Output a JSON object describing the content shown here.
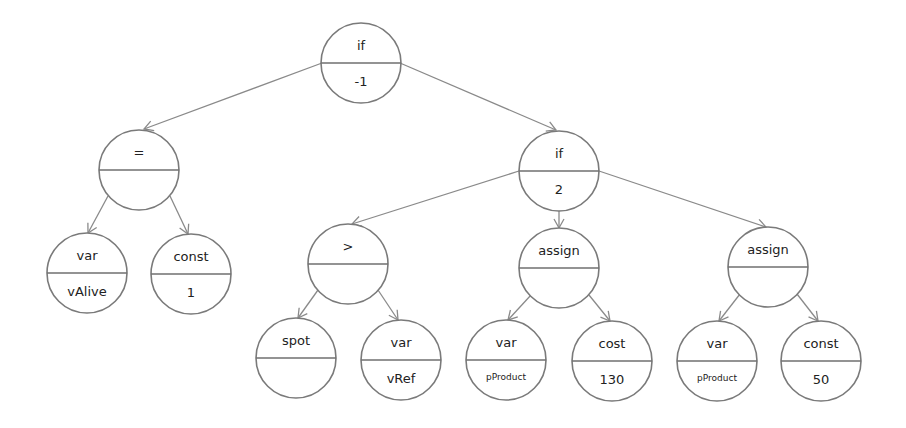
{
  "diagram": {
    "type": "expression-tree",
    "nodes": [
      {
        "id": "n0",
        "op": "if",
        "value": "-1",
        "cx": 361,
        "cy": 63,
        "r": 40
      },
      {
        "id": "n1",
        "op": "=",
        "value": "",
        "cx": 139,
        "cy": 170,
        "r": 40
      },
      {
        "id": "n2",
        "op": "if",
        "value": "2",
        "cx": 559,
        "cy": 171,
        "r": 40
      },
      {
        "id": "n3",
        "op": "var",
        "value": "vAlive",
        "cx": 87,
        "cy": 273,
        "r": 40
      },
      {
        "id": "n4",
        "op": "const",
        "value": "1",
        "cx": 191,
        "cy": 274,
        "r": 40
      },
      {
        "id": "n5",
        "op": ">",
        "value": "",
        "cx": 348,
        "cy": 264,
        "r": 40
      },
      {
        "id": "n6",
        "op": "assign",
        "value": "",
        "cx": 559,
        "cy": 268,
        "r": 40
      },
      {
        "id": "n7",
        "op": "assign",
        "value": "",
        "cx": 768,
        "cy": 267,
        "r": 40
      },
      {
        "id": "n8",
        "op": "spot",
        "value": "",
        "cx": 296,
        "cy": 358,
        "r": 40
      },
      {
        "id": "n9",
        "op": "var",
        "value": "vRef",
        "cx": 401,
        "cy": 360,
        "r": 40
      },
      {
        "id": "n10",
        "op": "var",
        "value": "pProduct",
        "cx": 506,
        "cy": 360,
        "r": 40,
        "small": true
      },
      {
        "id": "n11",
        "op": "cost",
        "value": "130",
        "cx": 612,
        "cy": 361,
        "r": 40
      },
      {
        "id": "n12",
        "op": "var",
        "value": "pProduct",
        "cx": 717,
        "cy": 361,
        "r": 40,
        "small": true
      },
      {
        "id": "n13",
        "op": "const",
        "value": "50",
        "cx": 821,
        "cy": 361,
        "r": 40
      }
    ],
    "edges": [
      {
        "from": "n0",
        "to": "n1",
        "x1": 322,
        "y1": 63,
        "x2": 144,
        "y2": 129
      },
      {
        "from": "n0",
        "to": "n2",
        "x1": 400,
        "y1": 63,
        "x2": 556,
        "y2": 130
      },
      {
        "from": "n1",
        "to": "n3",
        "x1": 108,
        "y1": 196,
        "x2": 88,
        "y2": 233
      },
      {
        "from": "n1",
        "to": "n4",
        "x1": 170,
        "y1": 196,
        "x2": 188,
        "y2": 234
      },
      {
        "from": "n2",
        "to": "n5",
        "x1": 519,
        "y1": 171,
        "x2": 352,
        "y2": 224
      },
      {
        "from": "n2",
        "to": "n6",
        "x1": 559,
        "y1": 211,
        "x2": 559,
        "y2": 228
      },
      {
        "from": "n2",
        "to": "n7",
        "x1": 599,
        "y1": 171,
        "x2": 766,
        "y2": 227
      },
      {
        "from": "n5",
        "to": "n8",
        "x1": 318,
        "y1": 290,
        "x2": 298,
        "y2": 318
      },
      {
        "from": "n5",
        "to": "n9",
        "x1": 378,
        "y1": 290,
        "x2": 398,
        "y2": 320
      },
      {
        "from": "n6",
        "to": "n10",
        "x1": 531,
        "y1": 295,
        "x2": 508,
        "y2": 320
      },
      {
        "from": "n6",
        "to": "n11",
        "x1": 589,
        "y1": 295,
        "x2": 610,
        "y2": 321
      },
      {
        "from": "n7",
        "to": "n12",
        "x1": 740,
        "y1": 294,
        "x2": 719,
        "y2": 321
      },
      {
        "from": "n7",
        "to": "n13",
        "x1": 797,
        "y1": 294,
        "x2": 818,
        "y2": 321
      }
    ]
  }
}
